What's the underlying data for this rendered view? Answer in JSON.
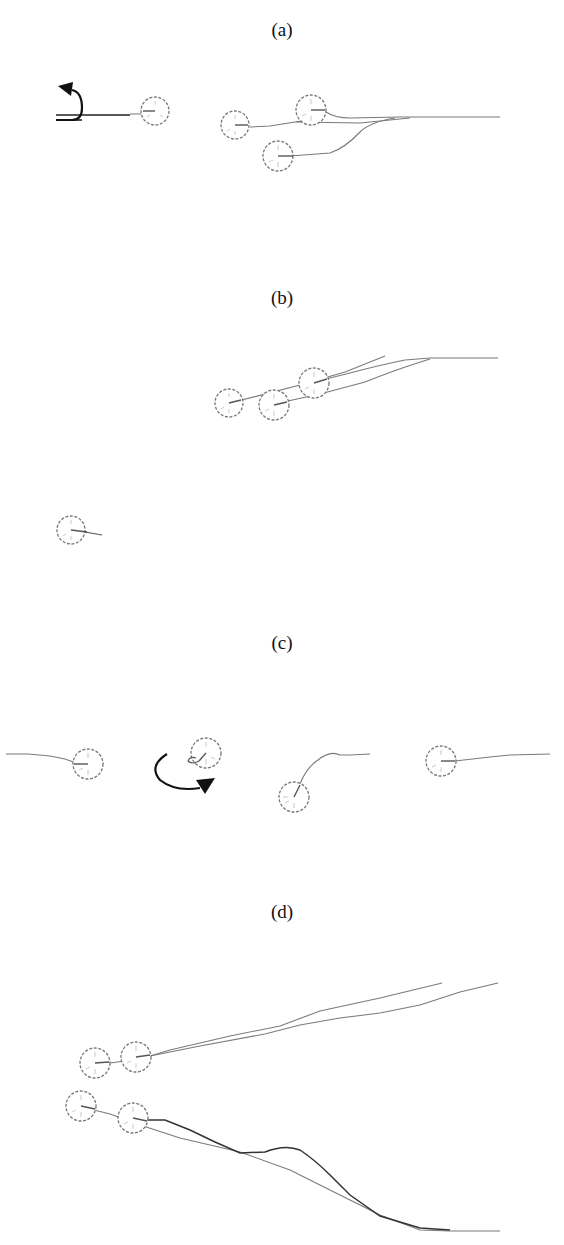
{
  "figure": {
    "panels": [
      {
        "id": "a",
        "label": "(a)",
        "description": "Robot executes a U-turn (curved arrow) at left; three robots converge from a single trajectory on the right",
        "robots": [
          {
            "x": 160,
            "y": 112,
            "heading": 180
          },
          {
            "x": 237,
            "y": 125,
            "heading": 0
          },
          {
            "x": 311,
            "y": 110,
            "heading": 0
          },
          {
            "x": 280,
            "y": 157,
            "heading": 0
          }
        ],
        "annotations": [
          "u-turn-arrow"
        ]
      },
      {
        "id": "b",
        "label": "(b)",
        "description": "Three robots diverging diagonally from a shared trajectory; one isolated robot at lower left",
        "robots": [
          {
            "x": 230,
            "y": 403,
            "heading": -15
          },
          {
            "x": 274,
            "y": 405,
            "heading": -15
          },
          {
            "x": 314,
            "y": 383,
            "heading": -15
          },
          {
            "x": 72,
            "y": 531,
            "heading": 10
          }
        ],
        "annotations": []
      },
      {
        "id": "c",
        "label": "(c)",
        "description": "Four robots: one arriving from left, one rotating in place (circular arrow), one turning upward, one arriving from right",
        "robots": [
          {
            "x": 88,
            "y": 765,
            "heading": 180
          },
          {
            "x": 206,
            "y": 753,
            "heading": 200
          },
          {
            "x": 295,
            "y": 796,
            "heading": -60
          },
          {
            "x": 441,
            "y": 761,
            "heading": 0
          }
        ],
        "annotations": [
          "rotation-arrow"
        ]
      },
      {
        "id": "d",
        "label": "(d)",
        "description": "Two pairs of robots: upper pair follows diverging up-right trajectories, lower pair follows down-right S-shaped trajectories",
        "robots": [
          {
            "x": 96,
            "y": 1063,
            "heading": 0
          },
          {
            "x": 136,
            "y": 1057,
            "heading": 0
          },
          {
            "x": 81,
            "y": 1107,
            "heading": 10
          },
          {
            "x": 133,
            "y": 1118,
            "heading": 10
          }
        ],
        "annotations": []
      }
    ]
  }
}
